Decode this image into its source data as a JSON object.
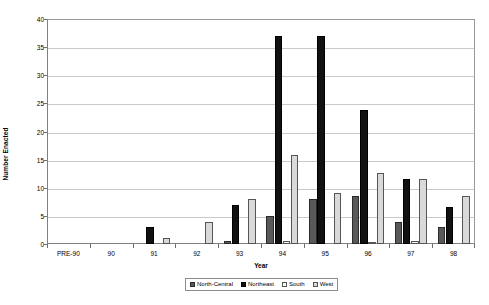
{
  "chart_data": {
    "type": "bar",
    "title": "",
    "xlabel": "Year",
    "ylabel": "Number Enacted",
    "ylim": [
      0,
      40
    ],
    "ytick_step": 5,
    "yticks": [
      0,
      5,
      10,
      15,
      20,
      25,
      30,
      35,
      40
    ],
    "grid": true,
    "legend_position": "bottom",
    "categories": [
      "PRE-90",
      "90",
      "91",
      "92",
      "93",
      "94",
      "95",
      "96",
      "97",
      "98"
    ],
    "series": [
      {
        "name": "North-Central",
        "color": "#595959",
        "values": [
          0,
          0,
          0,
          0,
          0.5,
          5,
          8,
          8.5,
          4,
          3
        ]
      },
      {
        "name": "Northeast",
        "color": "#111111",
        "values": [
          0,
          0,
          3,
          0,
          7,
          37,
          37,
          23.8,
          11.5,
          6.5
        ]
      },
      {
        "name": "South",
        "color": "#fbfbfb",
        "values": [
          0,
          0,
          0,
          0,
          0,
          0.5,
          0,
          0.4,
          0.5,
          0
        ]
      },
      {
        "name": "West",
        "color": "#d9d9d9",
        "values": [
          0,
          0,
          1,
          4,
          8,
          15.8,
          9,
          12.6,
          11.5,
          8.5
        ]
      }
    ]
  },
  "legend": {
    "items": [
      {
        "label": "North-Central",
        "key": "north-central"
      },
      {
        "label": "Northeast",
        "key": "northeast"
      },
      {
        "label": "South",
        "key": "south"
      },
      {
        "label": "West",
        "key": "west"
      }
    ]
  },
  "axes": {
    "y_title": "Number Enacted",
    "x_title": "Year"
  }
}
